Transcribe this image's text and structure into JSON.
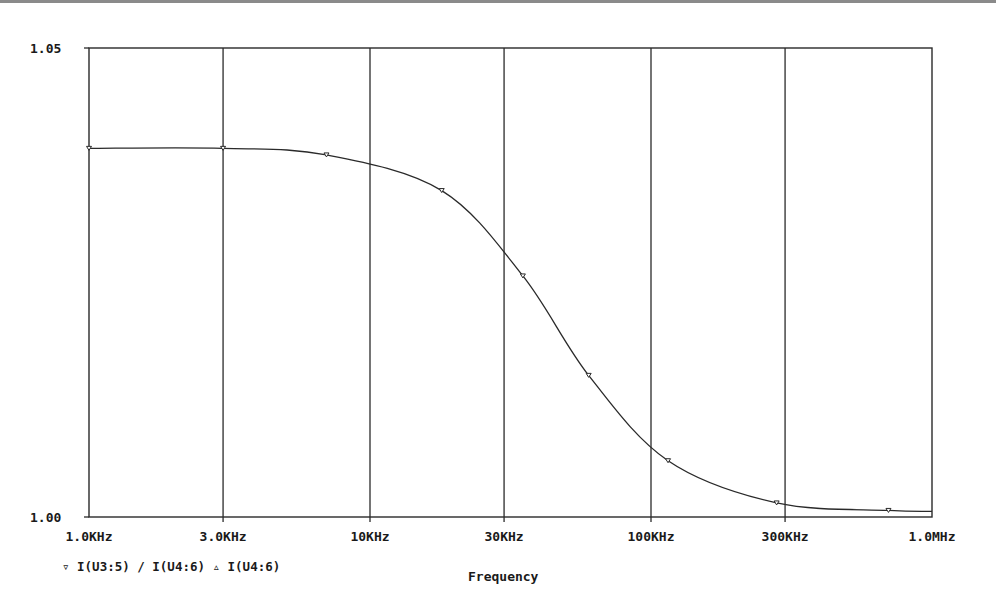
{
  "chart_data": {
    "type": "line",
    "title": "",
    "xlabel": "Frequency",
    "ylabel": "",
    "xscale": "log",
    "xlim": [
      1000,
      1000000
    ],
    "ylim": [
      1.0,
      1.05
    ],
    "x_ticks": [
      "1.0KHz",
      "3.0KHz",
      "10KHz",
      "30KHz",
      "100KHz",
      "300KHz",
      "1.0MHz"
    ],
    "y_ticks": [
      "1.00",
      "1.05"
    ],
    "grid": "vertical",
    "legend": [
      {
        "marker": "▿",
        "label": "I(U3:5) / I(U4:6)"
      },
      {
        "marker": "▵",
        "label": "I(U4:6)"
      }
    ],
    "series": [
      {
        "name": "I(U3:5) / I(U4:6)",
        "x": [
          1000,
          3000,
          7000,
          18000,
          35000,
          60000,
          115000,
          280000,
          700000,
          1000000
        ],
        "values": [
          1.0393,
          1.0393,
          1.0386,
          1.0348,
          1.0257,
          1.0151,
          1.006,
          1.0015,
          1.0007,
          1.0006
        ]
      }
    ]
  },
  "axis": {
    "y_top_label": "1.05",
    "y_bottom_label": "1.00",
    "x_labels": [
      "1.0KHz",
      "3.0KHz",
      "10KHz",
      "30KHz",
      "100KHz",
      "300KHz",
      "1.0MHz"
    ],
    "x_title": "Frequency"
  },
  "legend_text": "▿ I(U3:5) / I(U4:6) ▵ I(U4:6)",
  "colors": {
    "line": "#2a2a2a",
    "grid": "#2a2a2a",
    "background": "#ffffff"
  }
}
